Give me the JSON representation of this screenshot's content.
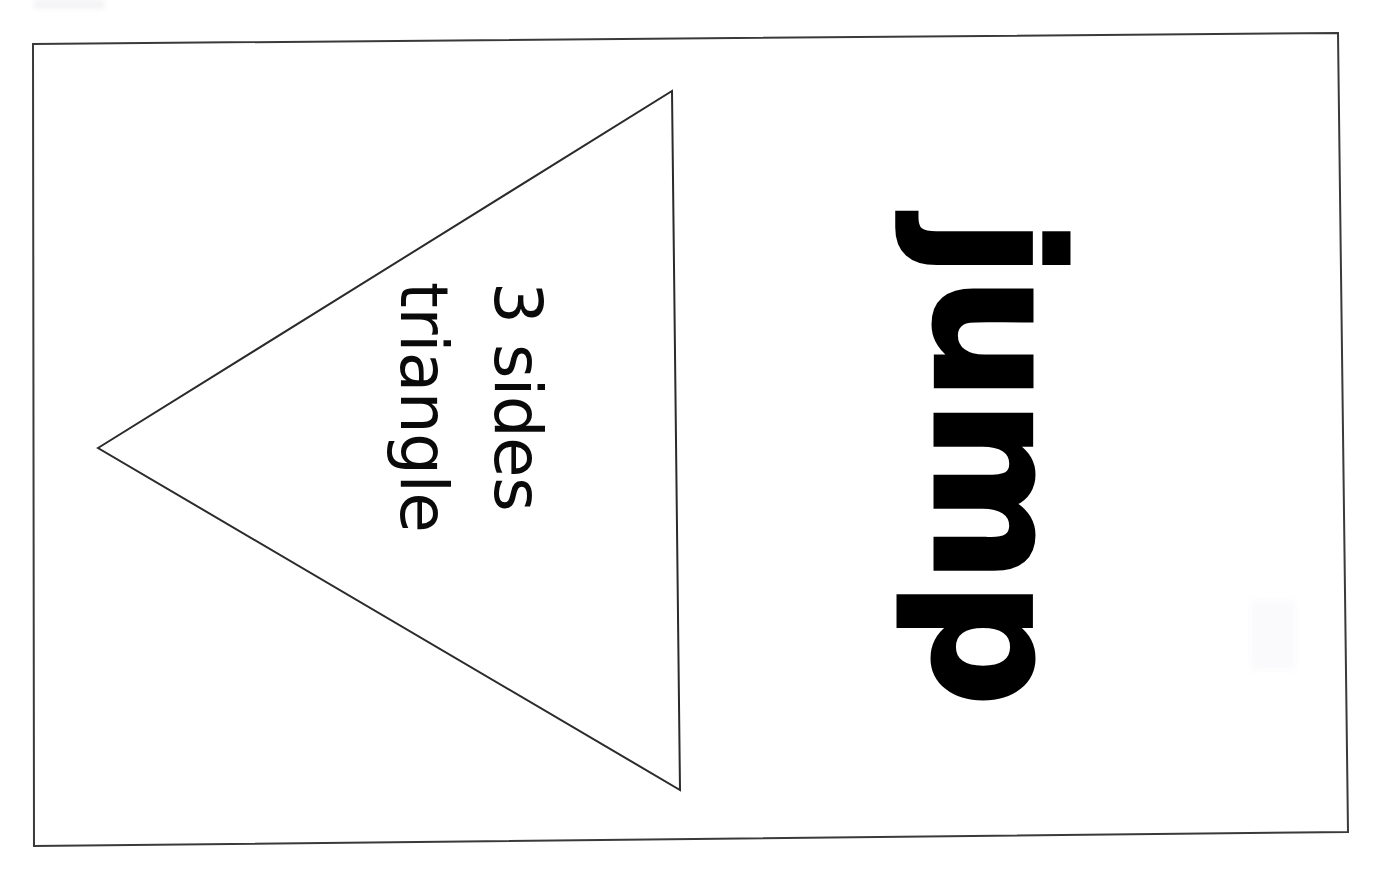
{
  "page": {
    "background_color": "#ffffff",
    "ink_color": "#000000",
    "frame": {
      "name": "border-rectangle",
      "stroke_color": "#3a3a3a",
      "stroke_width": 2,
      "corners": [
        {
          "x": 33,
          "y": 44
        },
        {
          "x": 1338,
          "y": 33
        },
        {
          "x": 1348,
          "y": 832
        },
        {
          "x": 34,
          "y": 846
        }
      ]
    }
  },
  "shape": {
    "name": "triangle-outline",
    "label": "triangle",
    "sides": "3",
    "stroke_color": "#2b2b2b",
    "stroke_width": 2,
    "fill": "none",
    "points": [
      {
        "x": 98,
        "y": 448
      },
      {
        "x": 672,
        "y": 91
      },
      {
        "x": 680,
        "y": 790
      }
    ]
  },
  "labels": {
    "line1": "triangle",
    "line2": "3 sides",
    "rotation_degrees": 90,
    "font_weight": "regular"
  },
  "word_card": {
    "word": "jump",
    "rotation_degrees": 90,
    "font_weight": "bold"
  }
}
